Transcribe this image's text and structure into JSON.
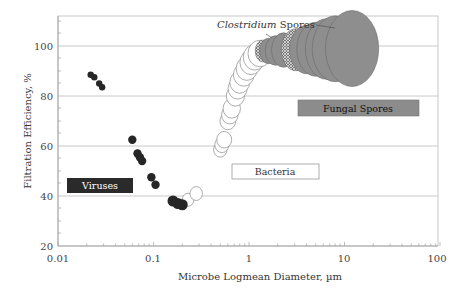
{
  "chart_data": {
    "type": "scatter",
    "title": "",
    "xlabel": "Microbe Logmean Diameter, µm",
    "ylabel": "Filtration Efficiency, %",
    "xscale": "log",
    "xlim": [
      0.01,
      100
    ],
    "ylim": [
      20,
      112
    ],
    "xticks": [
      "0.01",
      "0.1",
      "1",
      "10",
      "100"
    ],
    "yticks": [
      "20",
      "40",
      "60",
      "80",
      "100"
    ],
    "grid": "horizontal",
    "legend": "none",
    "annotations": [
      {
        "text": "Viruses",
        "style": "dark-box"
      },
      {
        "text": "Bacteria",
        "style": "white-box"
      },
      {
        "text": "Fungal Spores",
        "style": "gray-box"
      },
      {
        "text_italic": "Clostridium",
        "text": " Spores",
        "style": "leader-line"
      }
    ],
    "series": [
      {
        "name": "Viruses",
        "marker": "filled-black",
        "points": [
          {
            "x": 0.022,
            "y": 88.5
          },
          {
            "x": 0.024,
            "y": 87.5
          },
          {
            "x": 0.027,
            "y": 85
          },
          {
            "x": 0.029,
            "y": 83.5
          },
          {
            "x": 0.06,
            "y": 62.5
          },
          {
            "x": 0.068,
            "y": 57
          },
          {
            "x": 0.072,
            "y": 55.5
          },
          {
            "x": 0.076,
            "y": 54
          },
          {
            "x": 0.095,
            "y": 47.5
          },
          {
            "x": 0.105,
            "y": 44.5
          },
          {
            "x": 0.16,
            "y": 38
          },
          {
            "x": 0.18,
            "y": 37
          },
          {
            "x": 0.2,
            "y": 36.5
          }
        ]
      },
      {
        "name": "Bacteria",
        "marker": "open-circle",
        "points": [
          {
            "x": 0.23,
            "y": 38.5
          },
          {
            "x": 0.28,
            "y": 41
          },
          {
            "x": 0.5,
            "y": 58.5
          },
          {
            "x": 0.52,
            "y": 60.5
          },
          {
            "x": 0.55,
            "y": 62.5
          },
          {
            "x": 0.6,
            "y": 70
          },
          {
            "x": 0.63,
            "y": 72.5
          },
          {
            "x": 0.66,
            "y": 75
          },
          {
            "x": 0.72,
            "y": 80
          },
          {
            "x": 0.76,
            "y": 83
          },
          {
            "x": 0.8,
            "y": 85.5
          },
          {
            "x": 0.88,
            "y": 88.5
          },
          {
            "x": 0.95,
            "y": 91
          },
          {
            "x": 1.05,
            "y": 93.5
          },
          {
            "x": 1.15,
            "y": 95.5
          },
          {
            "x": 1.3,
            "y": 97
          }
        ]
      },
      {
        "name": "Clostridium Spores",
        "marker": "hatched",
        "points": [
          {
            "x": 1.4,
            "y": 98
          },
          {
            "x": 3.1,
            "y": 98.5
          }
        ]
      },
      {
        "name": "Fungal Spores",
        "marker": "filled-gray",
        "points": [
          {
            "x": 1.6,
            "y": 98
          },
          {
            "x": 1.9,
            "y": 98.2
          },
          {
            "x": 2.3,
            "y": 98.4
          },
          {
            "x": 4,
            "y": 98.6
          },
          {
            "x": 5,
            "y": 98.7
          },
          {
            "x": 6.5,
            "y": 98.8
          },
          {
            "x": 8,
            "y": 98.9
          },
          {
            "x": 12,
            "y": 99
          }
        ]
      }
    ]
  },
  "labels": {
    "xlabel": "Microbe Logmean Diameter, µm",
    "ylabel": "Filtration Efficiency, %",
    "viruses": "Viruses",
    "bacteria": "Bacteria",
    "fungal": "Fungal Spores",
    "clostridium_italic": "Clostridium",
    "clostridium_rest": " Spores",
    "xt0": "0.01",
    "xt1": "0.1",
    "xt2": "1",
    "xt3": "10",
    "xt4": "100",
    "yt0": "20",
    "yt1": "40",
    "yt2": "60",
    "yt3": "80",
    "yt4": "100"
  },
  "colors": {
    "virus_fill": "#262626",
    "bacteria_fill": "#ffffff",
    "fungal_fill": "#8e8e8e",
    "gridline": "#c8c8c8",
    "viruses_box": "#2a2a2a",
    "fungal_box": "#8c8c8c"
  }
}
